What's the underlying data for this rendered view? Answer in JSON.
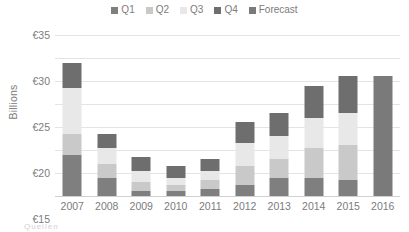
{
  "chart_data": {
    "type": "bar",
    "subtype": "stacked-column",
    "title": "",
    "xlabel": "",
    "ylabel": "Billions",
    "categories": [
      "2007",
      "2008",
      "2009",
      "2010",
      "2011",
      "2012",
      "2013",
      "2014",
      "2015",
      "2016"
    ],
    "ylim": [
      0,
      35
    ],
    "ytick_values": [
      0,
      5,
      10,
      15,
      20,
      25,
      30,
      35
    ],
    "ytick_labels": [
      "€0",
      "€5",
      "€10",
      "€15",
      "€20",
      "€25",
      "€30",
      "€35"
    ],
    "grid": true,
    "legend_position": "top-center",
    "currency_symbol": "€",
    "units": "Billions",
    "series": [
      {
        "name": "Q1",
        "color": "#7f7f7f",
        "values": [
          9.0,
          4.0,
          1.0,
          1.0,
          1.5,
          2.5,
          4.0,
          4.0,
          3.5,
          0
        ]
      },
      {
        "name": "Q2",
        "color": "#c9c9c9",
        "values": [
          4.5,
          3.0,
          2.0,
          1.5,
          2.0,
          4.0,
          4.0,
          6.5,
          7.5,
          0
        ]
      },
      {
        "name": "Q3",
        "color": "#e8e8e8",
        "values": [
          10.0,
          3.5,
          2.5,
          1.5,
          2.0,
          5.0,
          5.0,
          6.5,
          7.0,
          0
        ]
      },
      {
        "name": "Q4",
        "color": "#6e6e6e",
        "values": [
          5.5,
          3.0,
          3.0,
          2.5,
          2.5,
          4.5,
          5.0,
          7.0,
          8.0,
          0
        ]
      },
      {
        "name": "Forecast",
        "color": "#7a7a7a",
        "values": [
          0,
          0,
          0,
          0,
          0,
          0,
          0,
          0,
          0,
          26.0
        ]
      }
    ],
    "totals": [
      29.0,
      13.5,
      8.5,
      6.5,
      8.0,
      16.0,
      18.0,
      24.0,
      26.0,
      26.0
    ]
  },
  "legend": {
    "items": [
      {
        "label": "Q1",
        "color": "#7f7f7f"
      },
      {
        "label": "Q2",
        "color": "#c9c9c9"
      },
      {
        "label": "Q3",
        "color": "#e8e8e8"
      },
      {
        "label": "Q4",
        "color": "#6e6e6e"
      },
      {
        "label": "Forecast",
        "color": "#7a7a7a"
      }
    ]
  },
  "footnote": "Quellen"
}
